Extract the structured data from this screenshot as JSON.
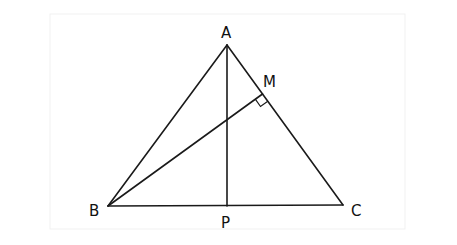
{
  "figure": {
    "type": "geometry-diagram",
    "points": {
      "A": {
        "label": "A"
      },
      "B": {
        "label": "B"
      },
      "C": {
        "label": "C"
      },
      "P": {
        "label": "P"
      },
      "M": {
        "label": "M"
      }
    },
    "segments": [
      {
        "from": "A",
        "to": "B",
        "name": "side-AB"
      },
      {
        "from": "B",
        "to": "C",
        "name": "side-BC"
      },
      {
        "from": "C",
        "to": "A",
        "name": "side-CA"
      },
      {
        "from": "A",
        "to": "P",
        "name": "altitude-AP"
      },
      {
        "from": "B",
        "to": "M",
        "name": "altitude-BM"
      }
    ],
    "right_angles": [
      {
        "at": "M",
        "between": [
          "B",
          "C"
        ]
      }
    ],
    "colors": {
      "stroke": "#1a1a1a",
      "text": "#111111",
      "background": "#ffffff"
    }
  }
}
